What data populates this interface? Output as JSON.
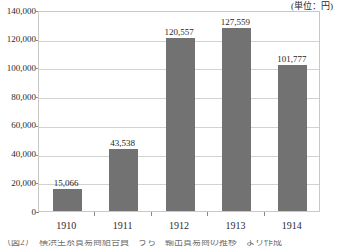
{
  "chart_data": {
    "type": "bar",
    "title": "",
    "subtitle": "",
    "unit_note": "(単位：円)",
    "xlabel": "",
    "ylabel": "",
    "categories": [
      "1910",
      "1911",
      "1912",
      "1913",
      "1914"
    ],
    "values": [
      15066,
      43538,
      120557,
      127559,
      101777
    ],
    "value_labels": [
      "15,066",
      "43,538",
      "120,557",
      "127,559",
      "101,777"
    ],
    "ylim": [
      0,
      140000
    ],
    "ytick_values": [
      0,
      20000,
      40000,
      60000,
      80000,
      100000,
      120000,
      140000
    ],
    "ytick_labels": [
      "0",
      "20,000",
      "40,000",
      "60,000",
      "80,000",
      "100,000",
      "120,000",
      "140,000"
    ],
    "grid": true,
    "grid_axis": "y",
    "legend": false,
    "legend_position": "none",
    "series": [
      {
        "name": "",
        "values": [
          15066,
          43538,
          120557,
          127559,
          101777
        ],
        "color": "#727272"
      }
    ]
  },
  "colors": {
    "bar_fill": "#727272",
    "grid_line": "#d2d2d2",
    "axis_line": "#8a8a8a",
    "plot_border": "#c8c8c8",
    "text": "#2b2b2b",
    "background": "#ffffff"
  },
  "caption": {
    "text": "（図2）　横浜生糸貿易商組合員　うち　輸出貿易商の推移　より作成"
  }
}
